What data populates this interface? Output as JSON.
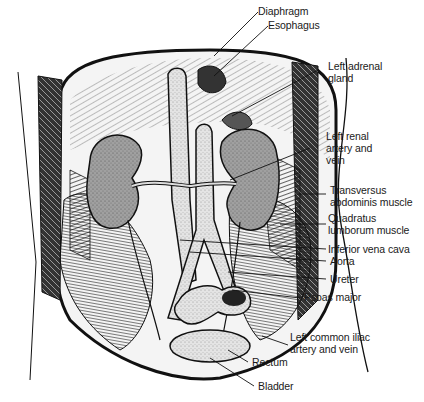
{
  "figure": {
    "colors": {
      "ink": "#111111",
      "kidney_fill": "#9a9a9a",
      "vessel_fill": "#d8d8d8",
      "bladder_fill": "#e6e6e6",
      "background": "#ffffff"
    }
  },
  "labels": [
    {
      "id": "diaphragm",
      "line1": "Diaphragm",
      "line2": ""
    },
    {
      "id": "esophagus",
      "line1": "Esophagus",
      "line2": ""
    },
    {
      "id": "left-adrenal-gland",
      "line1": "Left adrenal",
      "line2": "gland"
    },
    {
      "id": "left-renal-artery-vein",
      "line1": "Left renal",
      "line2": "artery and",
      "line3": "vein"
    },
    {
      "id": "transversus-abdominis",
      "line1": "Transversus",
      "line2": "abdominis muscle"
    },
    {
      "id": "quadratus-lumborum",
      "line1": "Quadratus",
      "line2": "lumborum muscle"
    },
    {
      "id": "inferior-vena-cava",
      "line1": "Inferior vena cava",
      "line2": ""
    },
    {
      "id": "aorta",
      "line1": "Aorta",
      "line2": ""
    },
    {
      "id": "ureter",
      "line1": "Ureter",
      "line2": ""
    },
    {
      "id": "psoas-major",
      "line1": "Psoas major",
      "line2": ""
    },
    {
      "id": "left-common-iliac",
      "line1": "Left common iliac",
      "line2": "artery and vein"
    },
    {
      "id": "rectum",
      "line1": "Rectum",
      "line2": ""
    },
    {
      "id": "bladder",
      "line1": "Bladder",
      "line2": ""
    }
  ]
}
